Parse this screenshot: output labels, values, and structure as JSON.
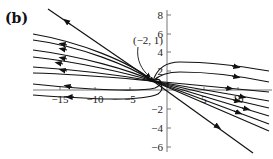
{
  "panel_label": "(b)",
  "annotation": {
    "text": "(−2, 1)",
    "point": [
      -2,
      1
    ]
  },
  "axes": {
    "x_ticks": [
      {
        "value": -15,
        "label": "−15"
      },
      {
        "value": -10,
        "label": "−10"
      },
      {
        "value": -5,
        "label": "−5"
      },
      {
        "value": 5,
        "label": "5"
      },
      {
        "value": 10,
        "label": "10"
      }
    ],
    "y_ticks": [
      {
        "value": 8,
        "label": "8"
      },
      {
        "value": 6,
        "label": "6"
      },
      {
        "value": 4,
        "label": "4"
      },
      {
        "value": 2,
        "label": "2"
      },
      {
        "value": -2,
        "label": "−2"
      },
      {
        "value": -4,
        "label": "−4"
      },
      {
        "value": -6,
        "label": "−6"
      }
    ]
  },
  "colors": {
    "curve": "#111111",
    "axis": "#777777"
  }
}
